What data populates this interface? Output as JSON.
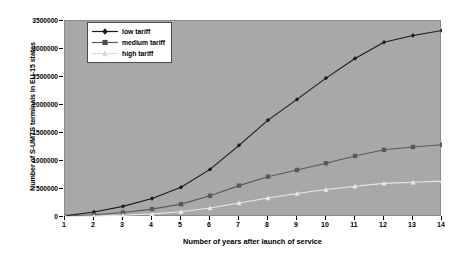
{
  "chart_data": {
    "type": "line",
    "title": "",
    "subtitle": "",
    "xlabel": "Number of years after launch of service",
    "ylabel": "Number of S-UMTS terminals in EU-15 states",
    "x": [
      1,
      2,
      3,
      4,
      5,
      6,
      7,
      8,
      9,
      10,
      11,
      12,
      13,
      14
    ],
    "xticklabels": [
      "1",
      "2",
      "3",
      "4",
      "5",
      "6",
      "7",
      "8",
      "9",
      "10",
      "11",
      "12",
      "13",
      "14"
    ],
    "yticklabels": [
      "0",
      "500000",
      "1000000",
      "1500000",
      "2000000",
      "2500000",
      "3000000",
      "3500000"
    ],
    "ytickvalues": [
      0,
      500000,
      1000000,
      1500000,
      2000000,
      2500000,
      3000000,
      3500000
    ],
    "xlim": [
      1,
      14
    ],
    "ylim": [
      0,
      3500000
    ],
    "grid": false,
    "legend_position": "top-left",
    "plot_background": "#a8a8a8",
    "series": [
      {
        "name": "low  tariff",
        "color": "#1a1a1a",
        "marker": "diamond",
        "values": [
          20000,
          90000,
          190000,
          330000,
          530000,
          850000,
          1280000,
          1730000,
          2100000,
          2480000,
          2830000,
          3120000,
          3240000,
          3330000
        ]
      },
      {
        "name": "medium tariff",
        "color": "#5a5a5a",
        "marker": "square",
        "values": [
          10000,
          40000,
          80000,
          140000,
          230000,
          380000,
          560000,
          720000,
          840000,
          960000,
          1090000,
          1200000,
          1250000,
          1290000
        ]
      },
      {
        "name": "high tariff",
        "color": "#e8e8e8",
        "marker": "triangle",
        "values": [
          5000,
          15000,
          30000,
          55000,
          95000,
          160000,
          250000,
          340000,
          420000,
          490000,
          550000,
          600000,
          620000,
          640000
        ]
      }
    ]
  },
  "legend": {
    "items": [
      {
        "label": "low  tariff"
      },
      {
        "label": "medium tariff"
      },
      {
        "label": "high tariff"
      }
    ]
  },
  "axes": {
    "x_title": "Number of years after launch of service",
    "y_title": "Number of S-UMTS terminals in EU-15 states"
  }
}
